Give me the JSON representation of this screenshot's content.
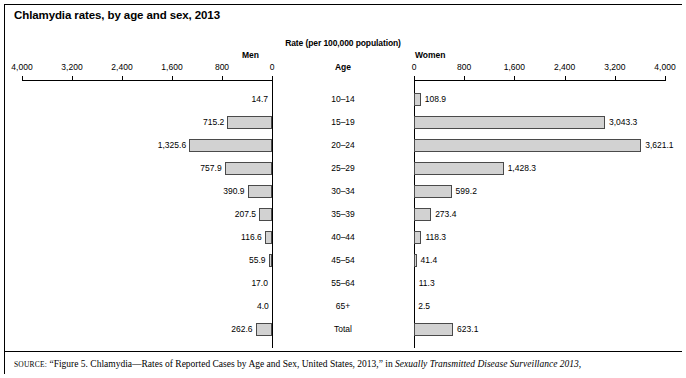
{
  "figure": {
    "title": "Chlamydia rates, by age and sex, 2013",
    "rate_header": "Rate (per 100,000 population)",
    "men_label": "Men",
    "women_label": "Women",
    "age_header": "Age"
  },
  "source_note": {
    "label": "SOURCE:",
    "text_before_italic": " “Figure 5. Chlamydia—Rates of Reported Cases by Age and Sex, United States, 2013,” in ",
    "italic_title": "Sexually Transmitted Disease Surveillance 2013,"
  },
  "chart_data": {
    "type": "bar",
    "title": "Chlamydia rates, by age and sex, 2013",
    "subtitle": "Rate (per 100,000 population)",
    "orientation": "horizontal",
    "layout": "population-pyramid",
    "xlabel": "Rate (per 100,000 population)",
    "ylabel": "Age",
    "xlim": [
      0,
      4000
    ],
    "grid": false,
    "legend": "none",
    "tick_labels": [
      "4,000",
      "3,200",
      "2,400",
      "1,600",
      "800",
      "0"
    ],
    "tick_values": [
      4000,
      3200,
      2400,
      1600,
      800,
      0
    ],
    "tick_labels_right": [
      "0",
      "800",
      "1,600",
      "2,400",
      "3,200",
      "4,000"
    ],
    "categories": [
      "10–14",
      "15–19",
      "20–24",
      "25–29",
      "30–34",
      "35–39",
      "40–44",
      "45–54",
      "55–64",
      "65+",
      "Total"
    ],
    "series": [
      {
        "name": "Men",
        "side": "left",
        "values": [
          14.7,
          715.2,
          1325.6,
          757.9,
          390.9,
          207.5,
          116.6,
          55.9,
          17.0,
          4.0,
          262.6
        ],
        "labels": [
          "14.7",
          "715.2",
          "1,325.6",
          "757.9",
          "390.9",
          "207.5",
          "116.6",
          "55.9",
          "17.0",
          "4.0",
          "262.6"
        ]
      },
      {
        "name": "Women",
        "side": "right",
        "values": [
          108.9,
          3043.3,
          3621.1,
          1428.3,
          599.2,
          273.4,
          118.3,
          41.4,
          11.3,
          2.5,
          623.1
        ],
        "labels": [
          "108.9",
          "3,043.3",
          "3,621.1",
          "1,428.3",
          "599.2",
          "273.4",
          "118.3",
          "41.4",
          "11.3",
          "2.5",
          "623.1"
        ]
      }
    ],
    "colors": {
      "bar_fill": "#d2d2d2",
      "bar_stroke": "#4a4a4a",
      "axis": "#000000",
      "text": "#000000",
      "background": "#ffffff"
    }
  }
}
